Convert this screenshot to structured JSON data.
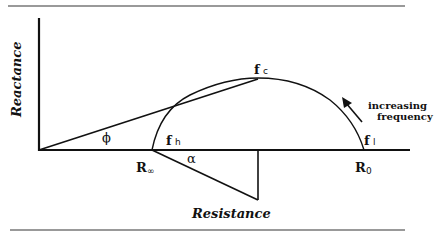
{
  "diagram": {
    "type": "Cole-Cole impedance plot",
    "axes": {
      "y_label": "Reactance",
      "x_label": "Resistance"
    },
    "points": {
      "r_inf": {
        "base": "R",
        "sub": "∞"
      },
      "r_zero": {
        "base": "R",
        "sub": "0"
      },
      "f_c": {
        "base": "f",
        "sub": "c"
      },
      "f_h": {
        "base": "f",
        "sub": "h"
      },
      "f_l": {
        "base": "f",
        "sub": "l"
      }
    },
    "angles": {
      "phi": "ϕ",
      "alpha": "α"
    },
    "annotation": {
      "line1": "increasing",
      "line2": "frequency"
    }
  }
}
